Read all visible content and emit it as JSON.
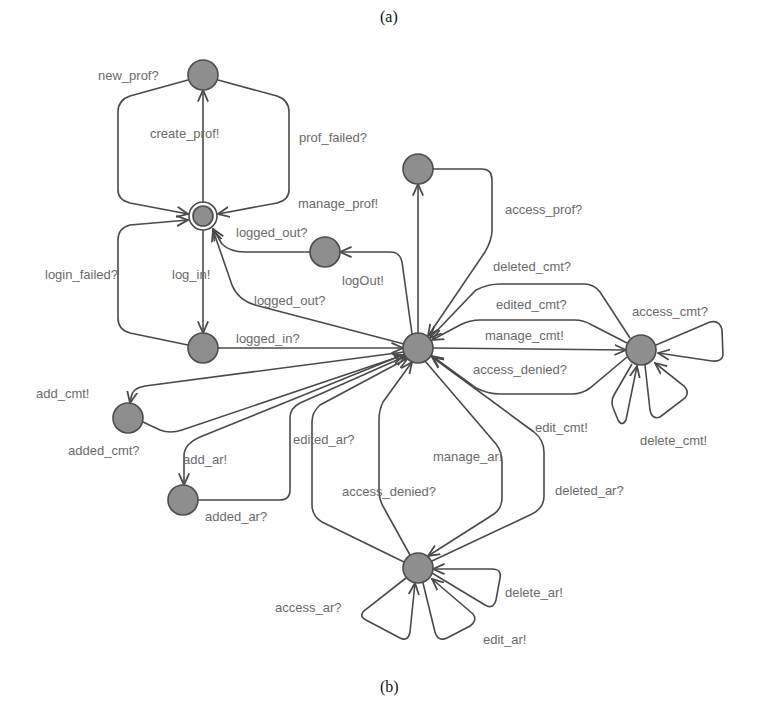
{
  "captions": {
    "top": "(a)",
    "bottom": "(b)"
  },
  "nodes": [
    {
      "id": "n_new_prof",
      "label": "new_prof?"
    },
    {
      "id": "n_init",
      "label": "",
      "initial": true
    },
    {
      "id": "n_logged_out",
      "label": ""
    },
    {
      "id": "n_logged_in",
      "label": ""
    },
    {
      "id": "n_hub",
      "label": ""
    },
    {
      "id": "n_prof",
      "label": ""
    },
    {
      "id": "n_cmt",
      "label": ""
    },
    {
      "id": "n_added_cmt",
      "label": ""
    },
    {
      "id": "n_added_ar",
      "label": ""
    },
    {
      "id": "n_ar",
      "label": ""
    }
  ],
  "edges": {
    "new_prof": "new_prof?",
    "create_prof": "create_prof!",
    "prof_failed": "prof_failed?",
    "manage_prof": "manage_prof!",
    "access_prof": "access_prof?",
    "logged_out_1": "logged_out?",
    "logout": "logOut!",
    "logged_out_2": "logged_out?",
    "login_failed": "login_failed?",
    "log_in": "log_in!",
    "logged_in": "logged_in?",
    "deleted_cmt": "deleted_cmt?",
    "edited_cmt": "edited_cmt?",
    "manage_cmt": "manage_cmt!",
    "access_denied_cmt": "access_denied?",
    "access_cmt": "access_cmt?",
    "edit_cmt": "edit_cmt!",
    "delete_cmt": "delete_cmt!",
    "add_cmt": "add_cmt!",
    "added_cmt": "added_cmt?",
    "add_ar": "add_ar!",
    "added_ar": "added_ar?",
    "edited_ar": "edited_ar?",
    "access_denied_ar": "access_denied?",
    "manage_ar": "manage_ar!",
    "deleted_ar": "deleted_ar?",
    "access_ar": "access_ar?",
    "edit_ar": "edit_ar!",
    "delete_ar": "delete_ar!"
  },
  "colors": {
    "node_fill": "#8e8e8e",
    "edge": "#4a4a4a",
    "label": "#6a6a6a"
  }
}
